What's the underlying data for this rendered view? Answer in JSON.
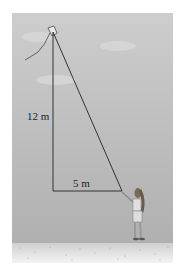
{
  "figure": {
    "labels": {
      "height": "12 m",
      "base": "5 m"
    },
    "colors": {
      "sky_top": "#c9c9c9",
      "sky_bottom": "#b3b3b3",
      "ground": "#e6e6e6",
      "line": "#333333"
    }
  }
}
